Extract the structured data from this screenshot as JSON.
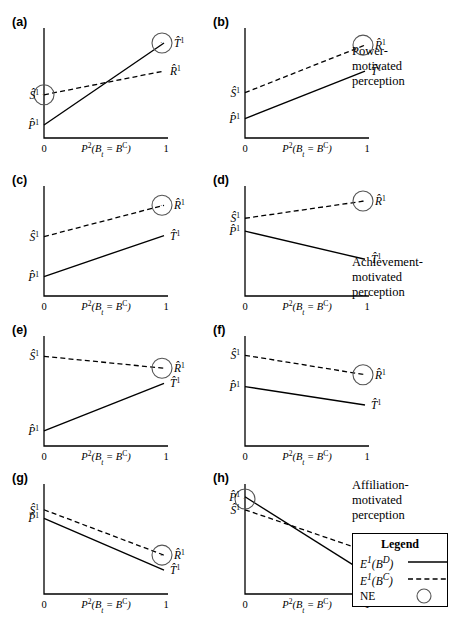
{
  "figure": {
    "type": "multi-panel-line-chart",
    "width": 456,
    "height": 625,
    "background": "#ffffff",
    "ink_color": "#000000"
  },
  "axis": {
    "x_title_html": "P<sup>2</sup>(B<sub>t</sub> = B<sup>C</sup>)",
    "x_tick_min": "0",
    "x_tick_max": "1",
    "x_range": [
      0,
      1
    ],
    "y_range": [
      0,
      1
    ],
    "grid": false
  },
  "legend": {
    "title": "Legend",
    "position": "bottom-right",
    "entries": [
      {
        "key_html": "E<sup>1</sup>(B<sup>D</sup>)",
        "sample": "solid-line",
        "italic": true
      },
      {
        "key_html": "E<sup>1</sup>(B<sup>C</sup>)",
        "sample": "dashed-line",
        "italic": true
      },
      {
        "key_html": "NE",
        "sample": "circle",
        "italic": false
      }
    ]
  },
  "side_captions": [
    {
      "name": "power-motivated-caption",
      "text": "Power-\nmotivated\nperception",
      "x": 352,
      "y": 44
    },
    {
      "name": "achievement-motivated-caption",
      "text": "Achievement-\nmotivated\nperception",
      "x": 352,
      "y": 255
    },
    {
      "name": "affiliation-motivated-caption",
      "text": "Affiliation-\nmotivated\nperception",
      "x": 352,
      "y": 478
    }
  ],
  "chart_data": {
    "type": "line",
    "xlabel": "P^2(B_t = B^C)",
    "ylabel": "",
    "xlim": [
      0,
      1
    ],
    "ylim": [
      0,
      1
    ],
    "shared_series": [
      {
        "name": "E^1(B^D)",
        "style": "solid",
        "endpoint_label": "T̂^1"
      },
      {
        "name": "E^1(B^C)",
        "style": "dashed",
        "endpoint_label": "R̂^1"
      }
    ],
    "panels": [
      {
        "tag": "(a)",
        "group": "power-motivated",
        "series": [
          {
            "name": "E^1(B^D)",
            "style": "solid",
            "x": [
              0,
              1
            ],
            "y": [
              0.12,
              0.88
            ],
            "end_label_html": "T̂<sup>1</sup>"
          },
          {
            "name": "E^1(B^C)",
            "style": "dashed",
            "x": [
              0,
              1
            ],
            "y": [
              0.4,
              0.62
            ],
            "end_label_html": "R̂<sup>1</sup>"
          }
        ],
        "y_axis_labels": [
          {
            "html": "Ŝ<sup>1</sup>",
            "value": 0.4
          },
          {
            "html": "P̂<sup>1</sup>",
            "value": 0.12
          }
        ],
        "nash_equilibria": [
          {
            "at": "left-intercept",
            "x": 0.0,
            "y": 0.4
          },
          {
            "at": "solid-right-end",
            "x": 1.0,
            "y": 0.88
          }
        ]
      },
      {
        "tag": "(b)",
        "group": "power-motivated",
        "series": [
          {
            "name": "E^1(B^D)",
            "style": "solid",
            "x": [
              0,
              1
            ],
            "y": [
              0.18,
              0.62
            ],
            "end_label_html": "T̂<sup>1</sup>"
          },
          {
            "name": "E^1(B^C)",
            "style": "dashed",
            "x": [
              0,
              1
            ],
            "y": [
              0.42,
              0.86
            ],
            "end_label_html": "R̂<sup>1</sup>"
          }
        ],
        "y_axis_labels": [
          {
            "html": "Ŝ<sup>1</sup>",
            "value": 0.42
          },
          {
            "html": "P̂<sup>1</sup>",
            "value": 0.18
          }
        ],
        "nash_equilibria": [
          {
            "at": "dashed-right-end",
            "x": 1.0,
            "y": 0.86
          }
        ]
      },
      {
        "tag": "(c)",
        "group": "achievement-motivated",
        "series": [
          {
            "name": "E^1(B^D)",
            "style": "solid",
            "x": [
              0,
              1
            ],
            "y": [
              0.18,
              0.56
            ],
            "end_label_html": "T̂<sup>1</sup>"
          },
          {
            "name": "E^1(B^C)",
            "style": "dashed",
            "x": [
              0,
              1
            ],
            "y": [
              0.55,
              0.84
            ],
            "end_label_html": "R̂<sup>1</sup>"
          }
        ],
        "y_axis_labels": [
          {
            "html": "Ŝ<sup>1</sup>",
            "value": 0.55
          },
          {
            "html": "P̂<sup>1</sup>",
            "value": 0.18
          }
        ],
        "nash_equilibria": [
          {
            "at": "dashed-right-end",
            "x": 1.0,
            "y": 0.84
          }
        ]
      },
      {
        "tag": "(d)",
        "group": "achievement-motivated",
        "series": [
          {
            "name": "E^1(B^D)",
            "style": "solid",
            "x": [
              0,
              1
            ],
            "y": [
              0.6,
              0.34
            ],
            "end_label_html": "T̂<sup>1</sup>"
          },
          {
            "name": "E^1(B^C)",
            "style": "dashed",
            "x": [
              0,
              1
            ],
            "y": [
              0.72,
              0.88
            ],
            "end_label_html": "R̂<sup>1</sup>"
          }
        ],
        "y_axis_labels": [
          {
            "html": "Ŝ<sup>1</sup>",
            "value": 0.72
          },
          {
            "html": "P̂<sup>1</sup>",
            "value": 0.6
          }
        ],
        "nash_equilibria": [
          {
            "at": "dashed-right-end",
            "x": 1.0,
            "y": 0.88
          }
        ]
      },
      {
        "tag": "(e)",
        "group": "affiliation-or-mixed",
        "series": [
          {
            "name": "E^1(B^D)",
            "style": "solid",
            "x": [
              0,
              1
            ],
            "y": [
              0.14,
              0.58
            ],
            "end_label_html": "T̂<sup>1</sup>"
          },
          {
            "name": "E^1(B^C)",
            "style": "dashed",
            "x": [
              0,
              1
            ],
            "y": [
              0.83,
              0.72
            ],
            "end_label_html": "R̂<sup>1</sup>"
          }
        ],
        "y_axis_labels": [
          {
            "html": "Ŝ<sup>1</sup>",
            "value": 0.83
          },
          {
            "html": "P̂<sup>1</sup>",
            "value": 0.14
          }
        ],
        "nash_equilibria": [
          {
            "at": "dashed-right-end",
            "x": 1.0,
            "y": 0.72
          }
        ]
      },
      {
        "tag": "(f)",
        "group": "affiliation-or-mixed",
        "series": [
          {
            "name": "E^1(B^D)",
            "style": "solid",
            "x": [
              0,
              1
            ],
            "y": [
              0.55,
              0.38
            ],
            "end_label_html": "T̂<sup>1</sup>"
          },
          {
            "name": "E^1(B^C)",
            "style": "dashed",
            "x": [
              0,
              1
            ],
            "y": [
              0.84,
              0.66
            ],
            "end_label_html": "R̂<sup>1</sup>"
          }
        ],
        "y_axis_labels": [
          {
            "html": "Ŝ<sup>1</sup>",
            "value": 0.84
          },
          {
            "html": "P̂<sup>1</sup>",
            "value": 0.55
          }
        ],
        "nash_equilibria": [
          {
            "at": "dashed-right-end",
            "x": 1.0,
            "y": 0.66
          }
        ]
      },
      {
        "tag": "(g)",
        "group": "affiliation-motivated",
        "series": [
          {
            "name": "E^1(B^D)",
            "style": "solid",
            "x": [
              0,
              1
            ],
            "y": [
              0.7,
              0.22
            ],
            "end_label_html": "T̂<sup>1</sup>"
          },
          {
            "name": "E^1(B^C)",
            "style": "dashed",
            "x": [
              0,
              1
            ],
            "y": [
              0.78,
              0.36
            ],
            "end_label_html": "R̂<sup>1</sup>"
          }
        ],
        "y_axis_labels": [
          {
            "html": "Ŝ<sup>1</sup>",
            "value": 0.78
          },
          {
            "html": "P̂<sup>1</sup>",
            "value": 0.7
          }
        ],
        "nash_equilibria": [
          {
            "at": "dashed-right-end",
            "x": 1.0,
            "y": 0.36
          }
        ]
      },
      {
        "tag": "(h)",
        "group": "affiliation-motivated",
        "series": [
          {
            "name": "E^1(B^D)",
            "style": "solid",
            "x": [
              0,
              1
            ],
            "y": [
              0.9,
              0.2
            ],
            "end_label_html": "T̂<sup>1</sup>"
          },
          {
            "name": "E^1(B^C)",
            "style": "dashed",
            "x": [
              0,
              1
            ],
            "y": [
              0.78,
              0.4
            ],
            "end_label_html": "R̂<sup>1</sup>"
          }
        ],
        "y_axis_labels": [
          {
            "html": "P̂<sup>1</sup>",
            "value": 0.9
          },
          {
            "html": "Ŝ<sup>1</sup>",
            "value": 0.78
          }
        ],
        "nash_equilibria": [
          {
            "at": "left-intercept",
            "x": 0.0,
            "y": 0.88
          },
          {
            "at": "dashed-right-end",
            "x": 1.0,
            "y": 0.4
          }
        ]
      }
    ]
  },
  "panel_layout": {
    "columns": 2,
    "rows": 4,
    "col_x": [
      44,
      245
    ],
    "row_y": [
      14,
      172,
      322,
      470
    ],
    "plot_width": 120,
    "plot_height": 108
  }
}
